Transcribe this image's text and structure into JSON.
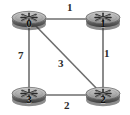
{
  "diagram": {
    "type": "network-graph",
    "background_color": "#ffffff",
    "edge_color": "#6e6e6e",
    "node_icon": "router-icon",
    "nodes": [
      {
        "id": "0",
        "label": "0",
        "x": 29,
        "y": 19
      },
      {
        "id": "1",
        "label": "1",
        "x": 103,
        "y": 19
      },
      {
        "id": "2",
        "label": "2",
        "x": 103,
        "y": 95
      },
      {
        "id": "3",
        "label": "3",
        "x": 29,
        "y": 95
      }
    ],
    "edges": [
      {
        "from": "0",
        "to": "1",
        "weight": "1",
        "label_x": 67,
        "label_y": 2
      },
      {
        "from": "0",
        "to": "3",
        "weight": "7",
        "label_x": 18,
        "label_y": 50
      },
      {
        "from": "0",
        "to": "2",
        "weight": "3",
        "label_x": 58,
        "label_y": 58
      },
      {
        "from": "1",
        "to": "2",
        "weight": "1",
        "label_x": 104,
        "label_y": 48
      },
      {
        "from": "3",
        "to": "2",
        "weight": "2",
        "label_x": 64,
        "label_y": 100
      }
    ]
  }
}
